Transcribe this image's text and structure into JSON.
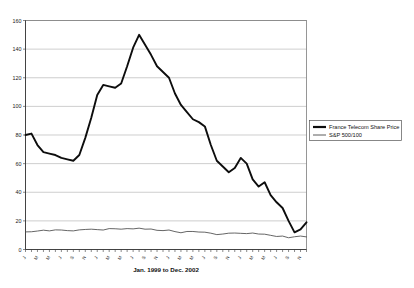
{
  "chart_data": {
    "type": "line",
    "title": "",
    "xlabel": "Jan. 1999 to Dec. 2002",
    "ylabel": "",
    "ylim": [
      0,
      160
    ],
    "ytick_values": [
      0,
      20,
      40,
      60,
      80,
      100,
      120,
      140,
      160
    ],
    "ytick_labels": [
      "0",
      "20",
      "40",
      "60",
      "80",
      "100",
      "120",
      "140",
      "160"
    ],
    "grid": true,
    "legend_position": "right",
    "x": [
      "Jan-99",
      "Feb-99",
      "Mar-99",
      "Apr-99",
      "May-99",
      "Jun-99",
      "Jul-99",
      "Aug-99",
      "Sep-99",
      "Oct-99",
      "Nov-99",
      "Dec-99",
      "Jan-00",
      "Feb-00",
      "Mar-00",
      "Apr-00",
      "May-00",
      "Jun-00",
      "Jul-00",
      "Aug-00",
      "Sep-00",
      "Oct-00",
      "Nov-00",
      "Dec-00",
      "Jan-01",
      "Feb-01",
      "Mar-01",
      "Apr-01",
      "May-01",
      "Jun-01",
      "Jul-01",
      "Aug-01",
      "Sep-01",
      "Oct-01",
      "Nov-01",
      "Dec-01",
      "Jan-02",
      "Feb-02",
      "Mar-02",
      "Apr-02",
      "May-02",
      "Jun-02",
      "Jul-02",
      "Aug-02",
      "Sep-02",
      "Oct-02",
      "Nov-02",
      "Dec-02"
    ],
    "xtick_labels": [
      "J",
      "M",
      "M",
      "J",
      "S",
      "N",
      "J",
      "M",
      "M",
      "J",
      "S",
      "N",
      "J",
      "M",
      "M",
      "J",
      "S",
      "N",
      "J",
      "M",
      "M",
      "J",
      "S",
      "N"
    ],
    "series": [
      {
        "name": "France Telecom Share Price",
        "style": "thick-black",
        "values": [
          80,
          81,
          73,
          68,
          67,
          66,
          64,
          63,
          62,
          66,
          78,
          92,
          108,
          115,
          114,
          113,
          116,
          128,
          141,
          150,
          143,
          136,
          128,
          124,
          120,
          109,
          101,
          96,
          91,
          89,
          86,
          73,
          62,
          58,
          54,
          57,
          64,
          60,
          49,
          44,
          47,
          38,
          33,
          29,
          20,
          12,
          14,
          19
        ]
      },
      {
        "name": "S&P 500/100",
        "style": "thin-gray",
        "values": [
          12.3,
          12.4,
          12.9,
          13.5,
          13.0,
          13.7,
          13.6,
          13.2,
          13.0,
          13.7,
          14.0,
          14.2,
          13.9,
          13.6,
          14.6,
          14.5,
          14.2,
          14.6,
          14.4,
          14.9,
          14.2,
          14.3,
          13.4,
          13.2,
          13.6,
          12.5,
          11.7,
          12.6,
          12.6,
          12.2,
          12.1,
          11.4,
          10.4,
          10.8,
          11.4,
          11.5,
          11.3,
          11.1,
          11.5,
          10.8,
          10.7,
          9.9,
          9.1,
          9.4,
          8.2,
          8.9,
          9.4,
          8.8
        ]
      }
    ]
  },
  "legend": {
    "entries": [
      {
        "label": "France Telecom Share Price"
      },
      {
        "label": "S&P 500/100"
      }
    ]
  }
}
